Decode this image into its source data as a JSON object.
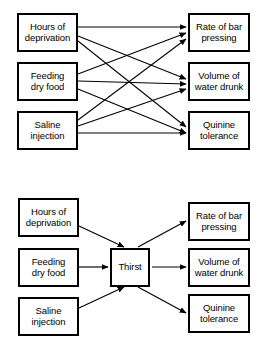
{
  "figure": {
    "background_color": "#ffffff",
    "line_color": "#000000",
    "box_border_color": "#000000"
  },
  "diagrams": [
    {
      "id": "top",
      "name": "direct-connections-diagram",
      "description": "Each of three independent variables connects directly to each of three dependent variables",
      "left_nodes": [
        {
          "id": "hours-of-deprivation",
          "label": "Hours of\ndeprivation"
        },
        {
          "id": "feeding-dry-food",
          "label": "Feeding\ndry food"
        },
        {
          "id": "saline-injection",
          "label": "Saline\ninjection"
        }
      ],
      "right_nodes": [
        {
          "id": "rate-of-bar-pressing",
          "label": "Rate of bar\npressing"
        },
        {
          "id": "volume-of-water-drunk",
          "label": "Volume of\nwater drunk"
        },
        {
          "id": "quinine-tolerance",
          "label": "Quinine\ntolerance"
        }
      ],
      "hub_node": null,
      "edges": [
        {
          "from": "hours-of-deprivation",
          "to": "rate-of-bar-pressing"
        },
        {
          "from": "hours-of-deprivation",
          "to": "volume-of-water-drunk"
        },
        {
          "from": "hours-of-deprivation",
          "to": "quinine-tolerance"
        },
        {
          "from": "feeding-dry-food",
          "to": "rate-of-bar-pressing"
        },
        {
          "from": "feeding-dry-food",
          "to": "volume-of-water-drunk"
        },
        {
          "from": "feeding-dry-food",
          "to": "quinine-tolerance"
        },
        {
          "from": "saline-injection",
          "to": "rate-of-bar-pressing"
        },
        {
          "from": "saline-injection",
          "to": "volume-of-water-drunk"
        },
        {
          "from": "saline-injection",
          "to": "quinine-tolerance"
        }
      ]
    },
    {
      "id": "bottom",
      "name": "intervening-variable-diagram",
      "description": "Three independent variables converge on the intervening variable Thirst, which connects to three dependent variables",
      "left_nodes": [
        {
          "id": "hours-of-deprivation-2",
          "label": "Hours of\ndeprivation"
        },
        {
          "id": "feeding-dry-food-2",
          "label": "Feeding\ndry food"
        },
        {
          "id": "saline-injection-2",
          "label": "Saline\ninjection"
        }
      ],
      "right_nodes": [
        {
          "id": "rate-of-bar-pressing-2",
          "label": "Rate of bar\npressing"
        },
        {
          "id": "volume-of-water-drunk-2",
          "label": "Volume of\nwater drunk"
        },
        {
          "id": "quinine-tolerance-2",
          "label": "Quinine\ntolerance"
        }
      ],
      "hub_node": {
        "id": "thirst",
        "label": "Thirst"
      },
      "edges": [
        {
          "from": "hours-of-deprivation-2",
          "to": "thirst"
        },
        {
          "from": "feeding-dry-food-2",
          "to": "thirst"
        },
        {
          "from": "saline-injection-2",
          "to": "thirst"
        },
        {
          "from": "thirst",
          "to": "rate-of-bar-pressing-2"
        },
        {
          "from": "thirst",
          "to": "volume-of-water-drunk-2"
        },
        {
          "from": "thirst",
          "to": "quinine-tolerance-2"
        }
      ]
    }
  ]
}
